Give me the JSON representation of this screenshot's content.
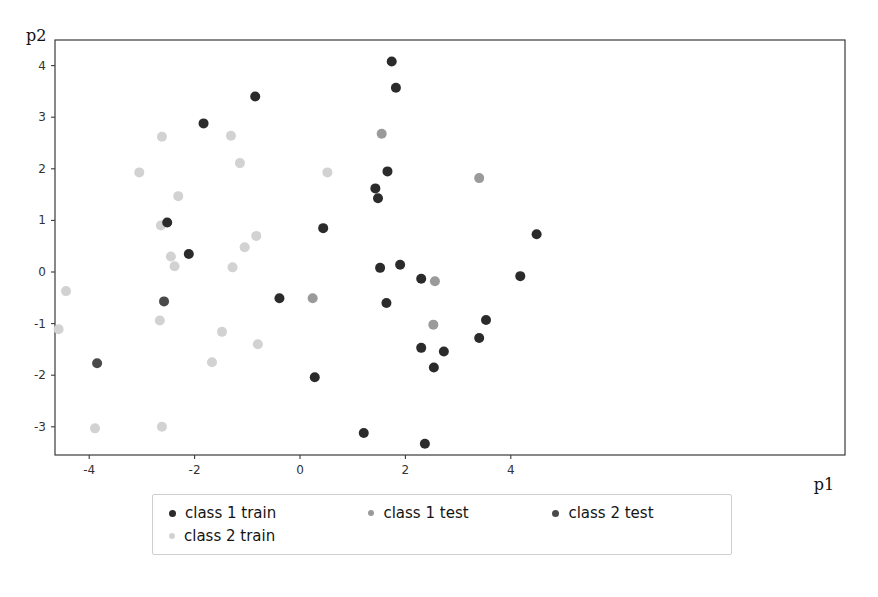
{
  "axes": {
    "xlabel": "p1",
    "ylabel": "p2",
    "xticks": [
      "-4",
      "-2",
      "0",
      "2",
      "4"
    ],
    "yticks": [
      "4",
      "3",
      "2",
      "1",
      "0",
      "-1",
      "-2",
      "-3"
    ]
  },
  "legend": {
    "entries": [
      {
        "label": "class 1 train",
        "color": "#2b2b2b"
      },
      {
        "label": "class 1 test",
        "color": "#9a9a9a"
      },
      {
        "label": "class 2 test",
        "color": "#4a4a4a"
      },
      {
        "label": "class 2 train",
        "color": "#d2d2d2"
      }
    ]
  },
  "colors": {
    "class_1_train": "#2b2b2b",
    "class_1_test": "#9a9a9a",
    "class_2_test": "#4a4a4a",
    "class_2_train": "#d2d2d2",
    "frame": "#3a3a3a",
    "background": "#ffffff"
  },
  "chart_data": {
    "type": "scatter",
    "title": "",
    "xlabel": "p1",
    "ylabel": "p2",
    "xlim": [
      -4.8,
      4.95
    ],
    "ylim": [
      -3.62,
      4.4
    ],
    "xticks": [
      -4,
      -2,
      0,
      2,
      4
    ],
    "yticks": [
      4,
      3,
      2,
      1,
      0,
      -1,
      -2,
      -3
    ],
    "grid": false,
    "legend_position": "below-axes",
    "marker_size": 5,
    "series": [
      {
        "name": "class 1 train",
        "color": "#2b2b2b",
        "points": [
          [
            -1.83,
            2.88
          ],
          [
            -0.85,
            3.4
          ],
          [
            -2.52,
            0.96
          ],
          [
            -2.11,
            0.35
          ],
          [
            1.74,
            4.08
          ],
          [
            1.82,
            3.57
          ],
          [
            1.66,
            1.95
          ],
          [
            1.43,
            1.62
          ],
          [
            1.48,
            1.43
          ],
          [
            0.44,
            0.85
          ],
          [
            1.52,
            0.08
          ],
          [
            1.9,
            0.14
          ],
          [
            2.3,
            -0.13
          ],
          [
            1.64,
            -0.6
          ],
          [
            4.49,
            0.73
          ],
          [
            4.18,
            -0.08
          ],
          [
            3.53,
            -0.93
          ],
          [
            3.4,
            -1.28
          ],
          [
            2.3,
            -1.47
          ],
          [
            2.73,
            -1.54
          ],
          [
            2.54,
            -1.85
          ],
          [
            -0.39,
            -0.51
          ],
          [
            0.28,
            -2.04
          ],
          [
            1.21,
            -3.12
          ],
          [
            2.37,
            -3.33
          ]
        ]
      },
      {
        "name": "class 2 test",
        "color": "#4a4a4a",
        "points": [
          [
            -3.85,
            -1.77
          ],
          [
            -2.58,
            -0.57
          ]
        ]
      },
      {
        "name": "class 1 test",
        "color": "#9a9a9a",
        "points": [
          [
            1.55,
            2.68
          ],
          [
            3.4,
            1.82
          ],
          [
            2.56,
            -0.18
          ],
          [
            2.53,
            -1.02
          ],
          [
            0.24,
            -0.51
          ]
        ]
      },
      {
        "name": "class 2 train",
        "color": "#d2d2d2",
        "points": [
          [
            -4.44,
            -0.37
          ],
          [
            -4.58,
            -1.11
          ],
          [
            -3.89,
            -3.03
          ],
          [
            -3.05,
            1.93
          ],
          [
            -2.62,
            2.62
          ],
          [
            -1.31,
            2.64
          ],
          [
            -1.14,
            2.11
          ],
          [
            -2.31,
            1.47
          ],
          [
            -2.64,
            0.9
          ],
          [
            -2.45,
            0.3
          ],
          [
            -2.38,
            0.11
          ],
          [
            -0.83,
            0.7
          ],
          [
            -1.05,
            0.48
          ],
          [
            -1.28,
            0.09
          ],
          [
            -2.66,
            -0.94
          ],
          [
            -1.48,
            -1.16
          ],
          [
            -1.67,
            -1.75
          ],
          [
            -2.62,
            -3.0
          ],
          [
            -0.8,
            -1.4
          ],
          [
            0.52,
            1.93
          ]
        ]
      }
    ]
  },
  "geometry": {
    "plot_left": 55,
    "plot_top": 40,
    "plot_right": 845,
    "plot_bottom": 455,
    "x_origin_px": 300,
    "y_origin_px": 272,
    "x_unit_px": 52.7,
    "y_unit_px": 51.6
  }
}
